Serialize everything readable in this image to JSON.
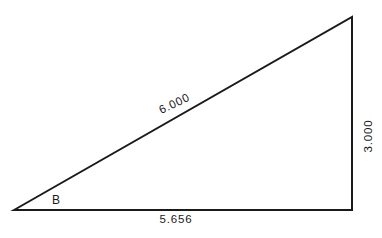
{
  "diagram": {
    "type": "right-triangle",
    "background_color": "#ffffff",
    "line_color": "#1a1a1a",
    "labels": {
      "hypotenuse": "6.000",
      "base": "5.656",
      "height": "3.000",
      "angle": "B"
    }
  }
}
